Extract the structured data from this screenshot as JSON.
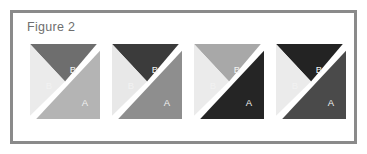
{
  "figure": {
    "caption": "Figure 2",
    "border_color": "#8a8a8a",
    "background_color": "#ffffff",
    "gap_color": "#ffffff"
  },
  "chart_data": {
    "type": "diagram",
    "title": "Figure 2",
    "label_a": "A",
    "label_b": "B",
    "squares": [
      {
        "index": 1,
        "top_b_label": "B",
        "left_b_label": "B",
        "a_label": "A",
        "top_b_color": "#6e6e6e",
        "left_b_color": "#ebebeb",
        "a_color": "#b4b4b4",
        "top_b_text_color": "#f2f2f2",
        "left_b_text_color": "#6b6b6b",
        "a_text_color": "#f2f2f2"
      },
      {
        "index": 2,
        "top_b_label": "B",
        "left_b_label": "B",
        "a_label": "A",
        "top_b_color": "#3b3b3b",
        "left_b_color": "#e8e8e8",
        "a_color": "#8e8e8e",
        "top_b_text_color": "#f2f2f2",
        "left_b_text_color": "#6b6b6b",
        "a_text_color": "#f2f2f2"
      },
      {
        "index": 3,
        "top_b_label": "B",
        "left_b_label": "B",
        "a_label": "A",
        "top_b_color": "#a8a8a8",
        "left_b_color": "#ebebeb",
        "a_color": "#252525",
        "top_b_text_color": "#f2f2f2",
        "left_b_text_color": "#6b6b6b",
        "a_text_color": "#f2f2f2"
      },
      {
        "index": 4,
        "top_b_label": "B",
        "left_b_label": "B",
        "a_label": "A",
        "top_b_color": "#232323",
        "left_b_color": "#ebebeb",
        "a_color": "#4a4a4a",
        "top_b_text_color": "#f2f2f2",
        "left_b_text_color": "#6b6b6b",
        "a_text_color": "#f2f2f2"
      }
    ]
  }
}
